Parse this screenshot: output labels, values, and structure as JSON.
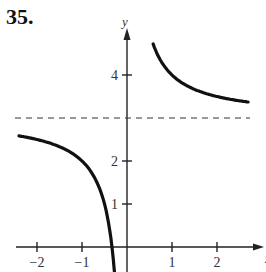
{
  "problem": {
    "number": "35."
  },
  "chart_data": {
    "type": "line",
    "title": "",
    "function_hint": "y = 3 + 1/x",
    "xlabel": "x",
    "ylabel": "y",
    "xlim": [
      -2.5,
      2.9
    ],
    "ylim": [
      -0.5,
      5.0
    ],
    "x_ticks": [
      -2,
      -1,
      1,
      2
    ],
    "x_tick_labels": [
      "−2",
      "−1",
      "1",
      "2"
    ],
    "y_ticks": [
      1,
      2,
      4
    ],
    "y_tick_labels": [
      "1",
      "2",
      "4"
    ],
    "asymptotes": [
      {
        "type": "horizontal",
        "y": 3,
        "style": "dashed"
      },
      {
        "type": "vertical",
        "x": 0,
        "style": "none"
      }
    ],
    "series": [
      {
        "name": "left-branch",
        "x": [
          -2.4,
          -2.0,
          -1.5,
          -1.0,
          -0.7,
          -0.5,
          -0.4,
          -0.33,
          -0.28
        ],
        "y": [
          2.58,
          2.5,
          2.33,
          2.0,
          1.57,
          1.0,
          0.5,
          0.0,
          -0.57
        ]
      },
      {
        "name": "right-branch",
        "x": [
          0.58,
          0.7,
          1.0,
          1.5,
          2.0,
          2.5,
          2.69
        ],
        "y": [
          4.72,
          4.43,
          4.0,
          3.67,
          3.5,
          3.4,
          3.37
        ]
      }
    ],
    "grid": false,
    "legend": null
  }
}
